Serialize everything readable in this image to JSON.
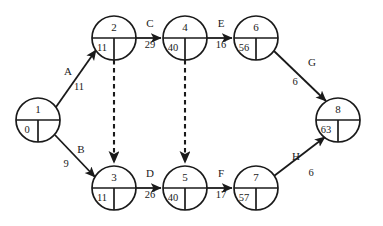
{
  "diagram": {
    "type": "activity-on-arrow-network",
    "nodes": [
      {
        "id": "1",
        "label": "1",
        "earliest": "0",
        "latest": "",
        "cx": 38,
        "cy": 120,
        "r": 22
      },
      {
        "id": "2",
        "label": "2",
        "earliest": "11",
        "latest": "",
        "cx": 114,
        "cy": 38,
        "r": 22
      },
      {
        "id": "3",
        "label": "3",
        "earliest": "11",
        "latest": "",
        "cx": 114,
        "cy": 188,
        "r": 22
      },
      {
        "id": "4",
        "label": "4",
        "earliest": "40",
        "latest": "",
        "cx": 185,
        "cy": 38,
        "r": 22
      },
      {
        "id": "5",
        "label": "5",
        "earliest": "40",
        "latest": "",
        "cx": 185,
        "cy": 188,
        "r": 22
      },
      {
        "id": "6",
        "label": "6",
        "earliest": "56",
        "latest": "",
        "cx": 256,
        "cy": 38,
        "r": 22
      },
      {
        "id": "7",
        "label": "7",
        "earliest": "57",
        "latest": "",
        "cx": 256,
        "cy": 188,
        "r": 22
      },
      {
        "id": "8",
        "label": "8",
        "earliest": "63",
        "latest": "",
        "cx": 338,
        "cy": 120,
        "r": 22
      }
    ],
    "arcs": [
      {
        "id": "A",
        "name": "A",
        "duration": "11",
        "from": "1",
        "to": "2",
        "style": "solid",
        "name_x": 68,
        "name_y": 72,
        "dur_x": 78,
        "dur_y": 87
      },
      {
        "id": "B",
        "name": "B",
        "duration": "9",
        "from": "1",
        "to": "3",
        "style": "solid",
        "name_x": 80,
        "name_y": 150,
        "dur_x": 67,
        "dur_y": 164
      },
      {
        "id": "C",
        "name": "C",
        "duration": "29",
        "from": "2",
        "to": "4",
        "style": "solid",
        "name_x": 150,
        "name_y": 24,
        "dur_x": 150,
        "dur_y": 45
      },
      {
        "id": "D",
        "name": "D",
        "duration": "26",
        "from": "3",
        "to": "5",
        "style": "solid",
        "name_x": 150,
        "name_y": 175,
        "dur_x": 150,
        "dur_y": 196
      },
      {
        "id": "E",
        "name": "E",
        "duration": "16",
        "from": "4",
        "to": "6",
        "style": "solid",
        "name_x": 221,
        "name_y": 24,
        "dur_x": 221,
        "dur_y": 45
      },
      {
        "id": "F",
        "name": "F",
        "duration": "17",
        "from": "5",
        "to": "7",
        "style": "solid",
        "name_x": 221,
        "name_y": 175,
        "dur_x": 221,
        "dur_y": 196
      },
      {
        "id": "G",
        "name": "G",
        "duration": "6",
        "from": "6",
        "to": "8",
        "style": "solid",
        "name_x": 311,
        "name_y": 63,
        "dur_x": 294,
        "dur_y": 82
      },
      {
        "id": "H",
        "name": "H",
        "duration": "6",
        "from": "7",
        "to": "8",
        "style": "solid",
        "name_x": 296,
        "name_y": 157,
        "dur_x": 311,
        "dur_y": 173
      }
    ],
    "dummies": [
      {
        "id": "dummy-2-3",
        "from": "2",
        "to": "3",
        "style": "dashed",
        "x": 114,
        "y1": 60,
        "y2": 166
      },
      {
        "id": "dummy-4-5",
        "from": "4",
        "to": "5",
        "style": "dashed",
        "x": 185,
        "y1": 60,
        "y2": 166
      }
    ],
    "colors": {
      "stroke": "#1a1a1a",
      "background": "#ffffff"
    }
  }
}
